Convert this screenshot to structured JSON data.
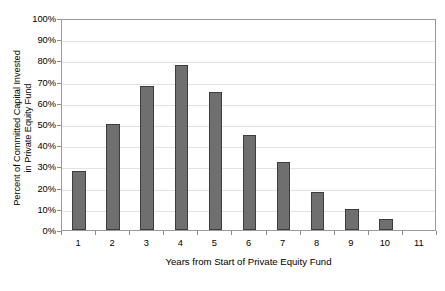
{
  "chart_data": {
    "type": "bar",
    "title": "",
    "xlabel": "Years from Start of Private Equity Fund",
    "ylabel": "Percent of Committed Capital Invested in Private Equity Fund",
    "ylabel_lines": [
      "Percent of Committed Capital Invested",
      "in Private Equity Fund"
    ],
    "categories": [
      "1",
      "2",
      "3",
      "4",
      "5",
      "6",
      "7",
      "8",
      "9",
      "10",
      "11"
    ],
    "values": [
      28,
      50,
      68,
      78,
      65,
      45,
      32,
      18,
      10,
      5,
      null
    ],
    "value_labels": [
      "28%",
      "50%",
      "68%",
      "78%",
      "65%",
      "45%",
      "32%",
      "18%",
      "10%",
      "5%",
      ""
    ],
    "ylim": [
      0,
      100
    ],
    "ytick_values": [
      0,
      10,
      20,
      30,
      40,
      50,
      60,
      70,
      80,
      90,
      100
    ],
    "ytick_labels": [
      "0%",
      "10%",
      "20%",
      "30%",
      "40%",
      "50%",
      "60%",
      "70%",
      "80%",
      "90%",
      "100%"
    ],
    "grid": true,
    "grid_axis": "y",
    "legend": false,
    "legend_position": "none",
    "bar_color": "#6f6f6f",
    "bar_edge_color": "#3d3d3d",
    "grid_color": "#e2e2e2",
    "axis_color": "#9a9a9a",
    "background_color": "#ffffff",
    "text_color": "#000000"
  }
}
